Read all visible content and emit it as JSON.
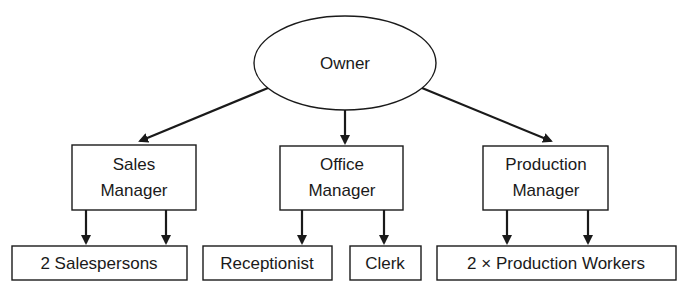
{
  "diagram": {
    "type": "organization-chart",
    "nodes": {
      "owner": {
        "label": "Owner",
        "shape": "ellipse"
      },
      "sales_manager": {
        "line1": "Sales",
        "line2": "Manager",
        "shape": "rect"
      },
      "office_manager": {
        "line1": "Office",
        "line2": "Manager",
        "shape": "rect"
      },
      "production_manager": {
        "line1": "Production",
        "line2": "Manager",
        "shape": "rect"
      },
      "salespersons": {
        "label": "2 Salespersons",
        "shape": "rect"
      },
      "receptionist": {
        "label": "Receptionist",
        "shape": "rect"
      },
      "clerk": {
        "label": "Clerk",
        "shape": "rect"
      },
      "production_workers": {
        "label": "2 × Production Workers",
        "shape": "rect"
      }
    },
    "edges": [
      {
        "from": "Owner",
        "to": "Sales Manager"
      },
      {
        "from": "Owner",
        "to": "Office Manager"
      },
      {
        "from": "Owner",
        "to": "Production Manager"
      },
      {
        "from": "Sales Manager",
        "to": "2 Salespersons",
        "count": 2
      },
      {
        "from": "Office Manager",
        "to": "Receptionist"
      },
      {
        "from": "Office Manager",
        "to": "Clerk"
      },
      {
        "from": "Production Manager",
        "to": "2 × Production Workers",
        "count": 2
      }
    ]
  }
}
